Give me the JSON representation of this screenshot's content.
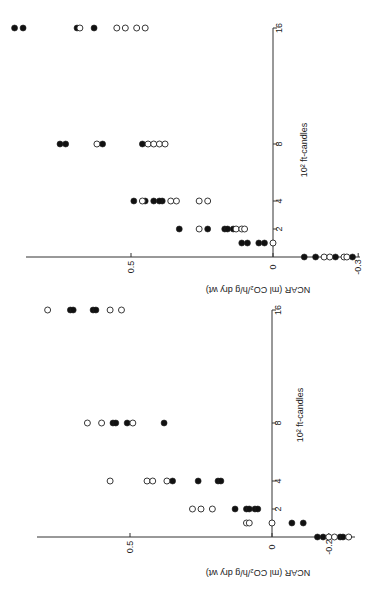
{
  "chart_data": [
    {
      "type": "scatter",
      "panel": "top",
      "xlabel": "10^2 ft-candles",
      "ylabel": "NCAR (ml CO2/h/g dry wt)",
      "x_ticks": [
        "16",
        "8",
        "4",
        "2"
      ],
      "y_ticks": [
        "0.5",
        "0",
        "-0.3"
      ],
      "ylim": [
        -0.3,
        0.95
      ],
      "orientation": "rotated 90deg (light on vertical axis, NCAR on horizontal axis reversed)",
      "series": [
        {
          "name": "filled",
          "marker": "filled-circle",
          "points": [
            [
              0,
              -0.11
            ],
            [
              0,
              -0.15
            ],
            [
              0,
              -0.22
            ],
            [
              0,
              -0.28
            ],
            [
              1,
              0.05
            ],
            [
              1,
              0.03
            ],
            [
              1,
              0.09
            ],
            [
              1,
              0.11
            ],
            [
              2,
              0.33
            ],
            [
              2,
              0.23
            ],
            [
              2,
              0.17
            ],
            [
              2,
              0.14
            ],
            [
              2,
              0.16
            ],
            [
              4,
              0.49
            ],
            [
              4,
              0.45
            ],
            [
              4,
              0.42
            ],
            [
              4,
              0.39
            ],
            [
              4,
              0.4
            ],
            [
              8,
              0.75
            ],
            [
              8,
              0.73
            ],
            [
              8,
              0.6
            ],
            [
              8,
              0.46
            ],
            [
              16,
              0.91
            ],
            [
              16,
              0.88
            ],
            [
              16,
              0.69
            ],
            [
              16,
              0.63
            ]
          ]
        },
        {
          "name": "open",
          "marker": "open-circle",
          "points": [
            [
              0,
              -0.18
            ],
            [
              0,
              -0.2
            ],
            [
              0,
              -0.25
            ],
            [
              0,
              -0.26
            ],
            [
              1,
              0.0
            ],
            [
              2,
              0.26
            ],
            [
              2,
              0.13
            ],
            [
              2,
              0.11
            ],
            [
              2,
              0.1
            ],
            [
              4,
              0.46
            ],
            [
              4,
              0.36
            ],
            [
              4,
              0.34
            ],
            [
              4,
              0.26
            ],
            [
              4,
              0.23
            ],
            [
              8,
              0.62
            ],
            [
              8,
              0.44
            ],
            [
              8,
              0.42
            ],
            [
              8,
              0.4
            ],
            [
              8,
              0.38
            ],
            [
              16,
              0.68
            ],
            [
              16,
              0.55
            ],
            [
              16,
              0.52
            ],
            [
              16,
              0.48
            ],
            [
              16,
              0.45
            ]
          ]
        }
      ]
    },
    {
      "type": "scatter",
      "panel": "bottom",
      "xlabel": "10^2 ft-candles",
      "ylabel": "NCAR (ml CO2/h/g dry wt)",
      "x_ticks": [
        "16",
        "8",
        "4",
        "2"
      ],
      "y_ticks": [
        "0.5",
        "0",
        "-0.2"
      ],
      "ylim": [
        -0.3,
        0.85
      ],
      "orientation": "rotated 90deg (light on vertical axis, NCAR on horizontal axis reversed)",
      "series": [
        {
          "name": "filled",
          "marker": "filled-circle",
          "points": [
            [
              0,
              -0.16
            ],
            [
              0,
              -0.18
            ],
            [
              0,
              -0.24
            ],
            [
              0,
              -0.25
            ],
            [
              1,
              -0.07
            ],
            [
              1,
              -0.11
            ],
            [
              2,
              0.13
            ],
            [
              2,
              0.09
            ],
            [
              2,
              0.08
            ],
            [
              2,
              0.06
            ],
            [
              2,
              0.05
            ],
            [
              4,
              0.35
            ],
            [
              4,
              0.26
            ],
            [
              4,
              0.19
            ],
            [
              4,
              0.18
            ],
            [
              8,
              0.56
            ],
            [
              8,
              0.55
            ],
            [
              8,
              0.51
            ],
            [
              8,
              0.38
            ],
            [
              16,
              0.71
            ],
            [
              16,
              0.7
            ],
            [
              16,
              0.63
            ],
            [
              16,
              0.62
            ]
          ]
        },
        {
          "name": "open",
          "marker": "open-circle",
          "points": [
            [
              0,
              -0.2
            ],
            [
              0,
              -0.22
            ],
            [
              0,
              -0.27
            ],
            [
              1,
              0.09
            ],
            [
              1,
              0.08
            ],
            [
              1,
              0.0
            ],
            [
              2,
              0.28
            ],
            [
              2,
              0.25
            ],
            [
              2,
              0.21
            ],
            [
              4,
              0.57
            ],
            [
              4,
              0.44
            ],
            [
              4,
              0.42
            ],
            [
              4,
              0.37
            ],
            [
              8,
              0.65
            ],
            [
              8,
              0.6
            ],
            [
              8,
              0.49
            ],
            [
              16,
              0.79
            ],
            [
              16,
              0.57
            ],
            [
              16,
              0.53
            ]
          ]
        }
      ]
    }
  ],
  "labels": {
    "top_ylabel": "NCAR (ml CO₂/h/g dry wt)",
    "top_xlabel": "10² ft-candles",
    "bottom_ylabel": "NCAR (ml CO₂/h/g dry wt)",
    "bottom_xlabel": "10² ft-candles"
  },
  "colors": {
    "ink": "#222222",
    "background": "#ffffff"
  }
}
